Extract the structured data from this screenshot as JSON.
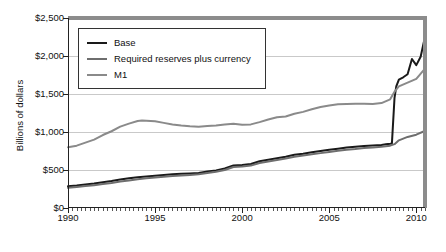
{
  "chart_data": {
    "type": "line",
    "title": "",
    "xlabel": "",
    "ylabel": "Billions of dollars",
    "xlim": [
      1990,
      2010.5
    ],
    "ylim": [
      0,
      2500
    ],
    "grid": true,
    "legend_position": "top-left-inside",
    "y_ticks": [
      0,
      500,
      1000,
      1500,
      2000,
      2500
    ],
    "y_tick_labels": [
      "$0",
      "$500",
      "$1,500",
      "$1,000",
      "$2,000",
      "$2,500"
    ],
    "y_tick_labels_ordered": [
      "$2,500",
      "$2,000",
      "$1,500",
      "$1,000",
      "$500",
      "$0"
    ],
    "x_ticks": [
      1990,
      1995,
      2000,
      2005,
      2010
    ],
    "x_tick_labels": [
      "1990",
      "1995",
      "2000",
      "2005",
      "2010"
    ],
    "x_minor_tick_interval": 0.25,
    "colors": {
      "base": "#1a1a1a",
      "required_reserves_plus_currency": "#6e6e6e",
      "m1": "#8a8a8a",
      "gridline": "#c9c9c9",
      "frame": "#8c8c8c",
      "axis": "#222222"
    },
    "series": [
      {
        "name": "Base",
        "color": "#1a1a1a",
        "width": 2.0,
        "x": [
          1990.0,
          1990.5,
          1991.0,
          1991.5,
          1992.0,
          1992.5,
          1993.0,
          1993.5,
          1994.0,
          1994.5,
          1995.0,
          1995.5,
          1996.0,
          1996.5,
          1997.0,
          1997.5,
          1998.0,
          1998.5,
          1999.0,
          1999.5,
          2000.0,
          2000.5,
          2001.0,
          2001.5,
          2002.0,
          2002.5,
          2003.0,
          2003.5,
          2004.0,
          2004.5,
          2005.0,
          2005.5,
          2006.0,
          2006.5,
          2007.0,
          2007.5,
          2008.0,
          2008.25,
          2008.5,
          2008.6,
          2008.75,
          2008.85,
          2009.0,
          2009.25,
          2009.5,
          2009.75,
          2010.0,
          2010.25,
          2010.45
        ],
        "y": [
          285,
          295,
          310,
          322,
          340,
          355,
          375,
          390,
          405,
          415,
          425,
          435,
          445,
          450,
          455,
          462,
          480,
          495,
          520,
          560,
          565,
          580,
          615,
          635,
          655,
          675,
          700,
          715,
          735,
          750,
          765,
          780,
          795,
          805,
          815,
          822,
          830,
          838,
          845,
          850,
          1450,
          1600,
          1690,
          1720,
          1760,
          1960,
          1880,
          1990,
          2200
        ]
      },
      {
        "name": "Required reserves plus currency",
        "color": "#6e6e6e",
        "width": 2.0,
        "x": [
          1990.0,
          1990.5,
          1991.0,
          1991.5,
          1992.0,
          1992.5,
          1993.0,
          1993.5,
          1994.0,
          1994.5,
          1995.0,
          1995.5,
          1996.0,
          1996.5,
          1997.0,
          1997.5,
          1998.0,
          1998.5,
          1999.0,
          1999.5,
          2000.0,
          2000.5,
          2001.0,
          2001.5,
          2002.0,
          2002.5,
          2003.0,
          2003.5,
          2004.0,
          2004.5,
          2005.0,
          2005.5,
          2006.0,
          2006.5,
          2007.0,
          2007.5,
          2008.0,
          2008.5,
          2008.75,
          2009.0,
          2009.5,
          2010.0,
          2010.45
        ],
        "y": [
          265,
          275,
          288,
          300,
          315,
          330,
          348,
          362,
          378,
          390,
          400,
          410,
          420,
          428,
          435,
          445,
          462,
          478,
          500,
          540,
          545,
          558,
          592,
          612,
          632,
          652,
          675,
          690,
          708,
          722,
          738,
          752,
          765,
          775,
          788,
          795,
          805,
          820,
          840,
          890,
          935,
          965,
          1010
        ]
      },
      {
        "name": "M1",
        "color": "#8a8a8a",
        "width": 2.0,
        "x": [
          1990.0,
          1990.5,
          1991.0,
          1991.5,
          1992.0,
          1992.5,
          1993.0,
          1993.5,
          1994.0,
          1994.25,
          1994.5,
          1995.0,
          1995.5,
          1996.0,
          1996.5,
          1997.0,
          1997.5,
          1998.0,
          1998.5,
          1999.0,
          1999.5,
          2000.0,
          2000.5,
          2001.0,
          2001.5,
          2002.0,
          2002.5,
          2003.0,
          2003.5,
          2004.0,
          2004.5,
          2005.0,
          2005.5,
          2006.0,
          2006.5,
          2007.0,
          2007.5,
          2008.0,
          2008.5,
          2008.75,
          2009.0,
          2009.5,
          2010.0,
          2010.45
        ],
        "y": [
          800,
          820,
          860,
          900,
          960,
          1010,
          1070,
          1110,
          1145,
          1152,
          1148,
          1140,
          1120,
          1098,
          1085,
          1075,
          1068,
          1078,
          1085,
          1098,
          1110,
          1095,
          1100,
          1130,
          1165,
          1195,
          1205,
          1240,
          1265,
          1300,
          1330,
          1350,
          1365,
          1370,
          1372,
          1372,
          1370,
          1380,
          1430,
          1530,
          1600,
          1650,
          1700,
          1820
        ]
      }
    ]
  },
  "legend": {
    "items": [
      {
        "label": "Base",
        "color": "#1a1a1a",
        "width": "2.2px"
      },
      {
        "label": "Required reserves plus currency",
        "color": "#6e6e6e",
        "width": "2.2px"
      },
      {
        "label": "M1",
        "color": "#8a8a8a",
        "width": "2.2px"
      }
    ]
  },
  "axes": {
    "y_title": "Billions of dollars"
  }
}
